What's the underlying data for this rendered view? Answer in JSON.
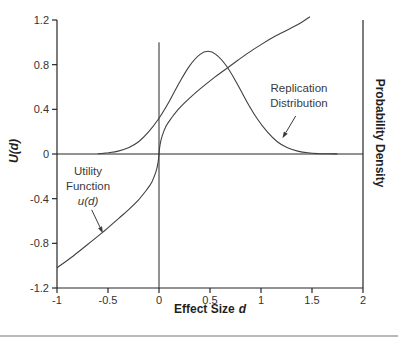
{
  "figure": {
    "background": "#ffffff",
    "axis_color": "#262626",
    "curve_color": "#404040",
    "tick_text_color": "#333333",
    "divider_color": "#b9b9b9"
  },
  "left_axis": {
    "label": "U(d)",
    "tick_labels": [
      "1.2",
      "0.8",
      "0.4",
      "0",
      "-0.4",
      "-0.8",
      "-1.2"
    ]
  },
  "right_axis": {
    "label": "Probability Density"
  },
  "x_axis": {
    "label_main": "Effect Size",
    "label_var": "d",
    "tick_labels": [
      "-1",
      "-0.5",
      "0",
      "0.5",
      "1",
      "1.5",
      "2"
    ]
  },
  "annotations": {
    "replication": {
      "line1": "Replication",
      "line2": "Distribution"
    },
    "utility": {
      "line1": "Utility",
      "line2": "Function",
      "line3": "u(d)"
    }
  },
  "chart_data": {
    "type": "line",
    "title": "",
    "xlabel": "Effect Size d",
    "ylabel_left": "U(d)",
    "ylabel_right": "Probability Density",
    "xlim": [
      -1,
      2
    ],
    "ylim": [
      -1.2,
      1.2
    ],
    "x_ticks": [
      -1,
      -0.5,
      0,
      0.5,
      1,
      1.5,
      2
    ],
    "y_ticks": [
      1.2,
      0.8,
      0.4,
      0,
      -0.4,
      -0.8,
      -1.2
    ],
    "grid": false,
    "legend": "none",
    "reference_lines": {
      "horizontal_at_y": 0,
      "vertical_at_x": 0,
      "vertical_span_y": [
        -1.2,
        1.0
      ]
    },
    "series": [
      {
        "name": "Utility Function u(d)",
        "shape": "s-curve through origin, near-vertical at d=0",
        "points": [
          [
            -1,
            -1.02
          ],
          [
            -0.85,
            -0.92
          ],
          [
            -0.7,
            -0.81
          ],
          [
            -0.55,
            -0.7
          ],
          [
            -0.4,
            -0.58
          ],
          [
            -0.3,
            -0.5
          ],
          [
            -0.2,
            -0.41
          ],
          [
            -0.12,
            -0.32
          ],
          [
            -0.07,
            -0.25
          ],
          [
            -0.03,
            -0.16
          ],
          [
            -0.01,
            -0.08
          ],
          [
            0,
            0
          ],
          [
            0.01,
            0.08
          ],
          [
            0.03,
            0.16
          ],
          [
            0.07,
            0.25
          ],
          [
            0.12,
            0.32
          ],
          [
            0.2,
            0.41
          ],
          [
            0.3,
            0.5
          ],
          [
            0.4,
            0.58
          ],
          [
            0.55,
            0.69
          ],
          [
            0.7,
            0.79
          ],
          [
            0.85,
            0.89
          ],
          [
            1.0,
            0.98
          ],
          [
            1.15,
            1.06
          ],
          [
            1.3,
            1.13
          ],
          [
            1.4,
            1.18
          ],
          [
            1.48,
            1.23
          ]
        ]
      },
      {
        "name": "Replication Distribution",
        "shape": "normal curve, mean 0.48, sd 0.33, peak 0.92 (left-axis units)",
        "points": [
          [
            -0.6,
            0.002
          ],
          [
            -0.5,
            0.011
          ],
          [
            -0.4,
            0.026
          ],
          [
            -0.3,
            0.056
          ],
          [
            -0.2,
            0.11
          ],
          [
            -0.1,
            0.2
          ],
          [
            0,
            0.32
          ],
          [
            0.1,
            0.47
          ],
          [
            0.2,
            0.64
          ],
          [
            0.3,
            0.79
          ],
          [
            0.4,
            0.89
          ],
          [
            0.48,
            0.92
          ],
          [
            0.56,
            0.89
          ],
          [
            0.66,
            0.79
          ],
          [
            0.76,
            0.64
          ],
          [
            0.86,
            0.47
          ],
          [
            0.96,
            0.32
          ],
          [
            1.06,
            0.2
          ],
          [
            1.16,
            0.11
          ],
          [
            1.26,
            0.056
          ],
          [
            1.36,
            0.026
          ],
          [
            1.46,
            0.011
          ],
          [
            1.56,
            0.004
          ],
          [
            1.66,
            0.002
          ],
          [
            1.75,
            0.001
          ]
        ]
      }
    ],
    "annotation_arrows": [
      {
        "label": "Replication Distribution",
        "from": [
          1.34,
          0.34
        ],
        "to": [
          1.21,
          0.14
        ]
      },
      {
        "label": "Utility Function u(d)",
        "from": [
          -0.66,
          -0.5
        ],
        "to": [
          -0.55,
          -0.71
        ]
      }
    ]
  }
}
